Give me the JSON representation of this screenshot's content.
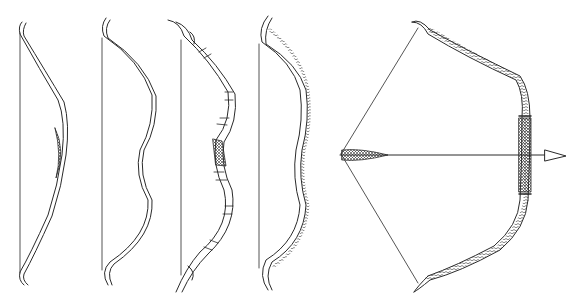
{
  "figure": {
    "type": "line-illustration",
    "background": "#ffffff",
    "stroke_color": "#2a2a2a",
    "items": [
      {
        "id": "bow-1",
        "description": "simple recurved bow with crosshatched grip, unstrung-string shown"
      },
      {
        "id": "bow-2",
        "description": "double-curved bow with scroll-shaped tips"
      },
      {
        "id": "bow-3",
        "description": "banded bow with ornate scroll tips and crosshatched grip"
      },
      {
        "id": "bow-4",
        "description": "double-curved bow with bead/scale-textured limbs"
      },
      {
        "id": "bow-5",
        "description": "drawn bow shaped like serpents with arrow nocked"
      }
    ]
  }
}
